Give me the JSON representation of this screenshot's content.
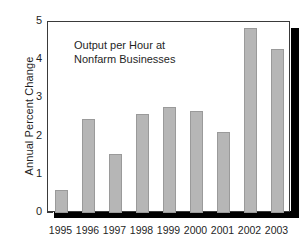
{
  "chart_data": {
    "type": "bar",
    "title": "",
    "annotation": "Output per Hour at\nNonfarm Businesses",
    "annotation_line1": "Output per Hour at",
    "annotation_line2": "Nonfarm Businesses",
    "xlabel": "",
    "ylabel": "Annual Percent Change",
    "categories": [
      "1995",
      "1996",
      "1997",
      "1998",
      "1999",
      "2000",
      "2001",
      "2002",
      "2003"
    ],
    "values": [
      0.6,
      2.45,
      1.55,
      2.6,
      2.77,
      2.68,
      2.12,
      4.85,
      4.3
    ],
    "ylim": [
      0,
      5
    ],
    "yticks": [
      "0",
      "1",
      "2",
      "3",
      "4",
      "5"
    ],
    "ytick_values": [
      0,
      1,
      2,
      3,
      4,
      5
    ],
    "grid": false,
    "legend": "none",
    "bar_color": "#b6b6b6",
    "bar_edge_color": "#9a9a9a",
    "axis_color": "#3a3a3a",
    "shadow_color": "#000000",
    "background": "#ffffff"
  }
}
